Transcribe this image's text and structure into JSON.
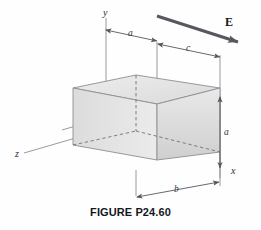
{
  "figure": {
    "caption": "FIGURE P24.60",
    "axes": [
      {
        "name": "y-axis",
        "label": "y"
      },
      {
        "name": "x-axis",
        "label": "x"
      },
      {
        "name": "z-axis",
        "label": "z"
      }
    ],
    "field": {
      "label": "E",
      "direction": "down-right",
      "description": "uniform electric field arrow"
    },
    "dimensions": [
      {
        "name": "offset-a-top",
        "label": "a",
        "orientation": "horizontal-top"
      },
      {
        "name": "width-c-top",
        "label": "c",
        "orientation": "horizontal-top"
      },
      {
        "name": "height-a-right",
        "label": "a",
        "orientation": "vertical-right"
      },
      {
        "name": "depth-b-bottom",
        "label": "b",
        "orientation": "horizontal-bottom"
      }
    ],
    "shape": {
      "name": "rectangular-box",
      "style": "shaded 3d cube with dashed hidden edges"
    },
    "colors": {
      "stroke": "#7b7f84",
      "dash": "#5d6166",
      "face_light": "#f2f2f2",
      "face_mid": "#e2e2e2",
      "face_dark": "#d2d2d2",
      "arrow": "#55585c",
      "text": "#15181c",
      "background": "#fefefe"
    }
  }
}
